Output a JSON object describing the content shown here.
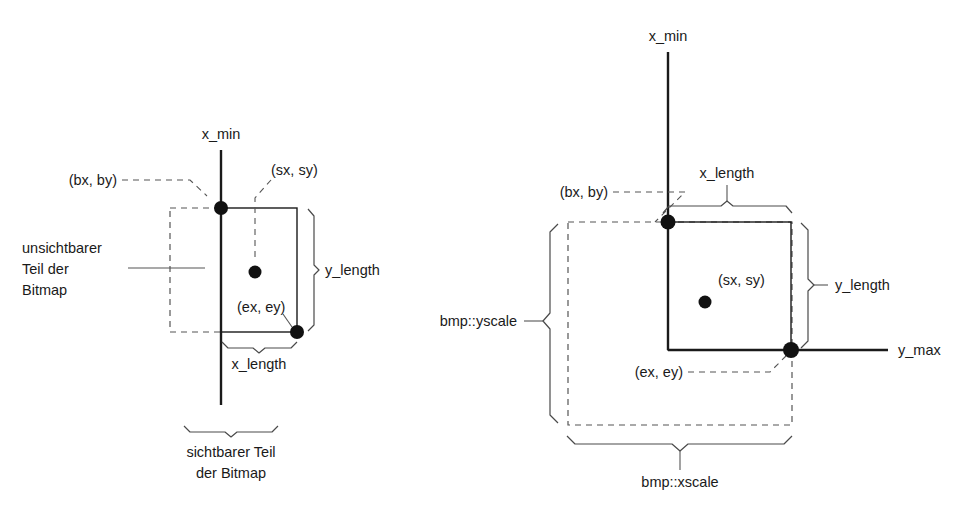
{
  "figure": {
    "title": "",
    "background_color": "#ffffff",
    "line_color": "#1a1a1a",
    "dashed_color": "#555555"
  },
  "left_diagram": {
    "name": "bitmap-clipping-left",
    "axis_label": "x_min",
    "point_labels": {
      "begin": "(bx, by)",
      "start": "(sx, sy)",
      "end": "(ex, ey)"
    },
    "dimension_labels": {
      "y_length": "y_length",
      "x_length": "x_length"
    },
    "annotations": {
      "invisible_part_line1": "unsichtbarer",
      "invisible_part_line2": "Teil der",
      "invisible_part_line3": "Bitmap",
      "visible_part_line1": "sichtbarer Teil",
      "visible_part_line2": "der Bitmap"
    }
  },
  "right_diagram": {
    "name": "bitmap-clipping-right",
    "axis_label_vertical": "x_min",
    "axis_label_horizontal": "y_max",
    "point_labels": {
      "begin": "(bx, by)",
      "start": "(sx, sy)",
      "end": "(ex, ey)"
    },
    "dimension_labels": {
      "x_length": "x_length",
      "y_length": "y_length",
      "bmp_yscale": "bmp::yscale",
      "bmp_xscale": "bmp::xscale"
    }
  }
}
